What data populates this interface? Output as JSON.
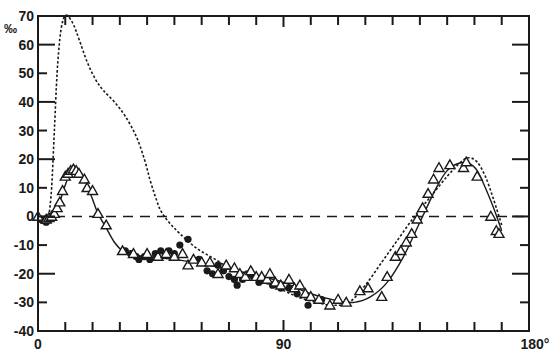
{
  "chart_data": {
    "type": "scatter",
    "title": "",
    "xlabel": "",
    "ylabel": "‰",
    "x_unit_label": "°",
    "xlim": [
      0,
      180
    ],
    "ylim": [
      -40,
      70
    ],
    "x_major_ticks": [
      0,
      90,
      180
    ],
    "x_tick_labels": [
      "0",
      "90",
      "180°"
    ],
    "x_minor_step": 10,
    "y_ticks": [
      -40,
      -30,
      -20,
      -10,
      0,
      10,
      20,
      30,
      40,
      50,
      60,
      70
    ],
    "y_tick_labels": [
      "-40",
      "-30",
      "-20",
      "-10",
      "0",
      "10",
      "20",
      "30",
      "40",
      "50",
      "60",
      "70"
    ],
    "y_unit_label": "‰",
    "grid": false,
    "legend": "none",
    "reference_lines": [
      {
        "y": 0,
        "style": "dashed"
      }
    ],
    "series": [
      {
        "name": "triangles",
        "marker": "open-triangle",
        "points": [
          [
            0,
            0
          ],
          [
            3,
            -1
          ],
          [
            4,
            -0.5
          ],
          [
            5,
            0
          ],
          [
            6,
            1
          ],
          [
            7,
            3
          ],
          [
            8,
            5
          ],
          [
            9,
            9
          ],
          [
            10,
            14
          ],
          [
            11,
            15
          ],
          [
            12,
            16
          ],
          [
            13,
            16.5
          ],
          [
            14,
            16
          ],
          [
            15,
            15
          ],
          [
            17,
            13
          ],
          [
            18,
            10
          ],
          [
            20,
            9
          ],
          [
            22,
            1
          ],
          [
            25,
            -3
          ],
          [
            31,
            -12
          ],
          [
            35,
            -13
          ],
          [
            40,
            -13
          ],
          [
            44,
            -14
          ],
          [
            47,
            -13
          ],
          [
            50,
            -14
          ],
          [
            53,
            -13
          ],
          [
            55,
            -17
          ],
          [
            57,
            -15
          ],
          [
            60,
            -16
          ],
          [
            63,
            -16
          ],
          [
            66,
            -20
          ],
          [
            69,
            -17
          ],
          [
            72,
            -18
          ],
          [
            74,
            -20
          ],
          [
            76,
            -21
          ],
          [
            78,
            -19
          ],
          [
            80,
            -21
          ],
          [
            82,
            -21
          ],
          [
            84,
            -22
          ],
          [
            85,
            -20
          ],
          [
            87,
            -23
          ],
          [
            89,
            -24
          ],
          [
            92,
            -22
          ],
          [
            94,
            -25
          ],
          [
            96,
            -24
          ],
          [
            98,
            -27
          ],
          [
            100,
            -28
          ],
          [
            103,
            -29
          ],
          [
            107,
            -31
          ],
          [
            110,
            -29
          ],
          [
            113,
            -30
          ],
          [
            118,
            -26
          ],
          [
            121,
            -25
          ],
          [
            126,
            -28
          ],
          [
            128,
            -21
          ],
          [
            131,
            -14
          ],
          [
            133,
            -12
          ],
          [
            135,
            -9
          ],
          [
            137,
            -6
          ],
          [
            139,
            -1
          ],
          [
            141,
            3
          ],
          [
            143,
            8
          ],
          [
            145,
            13
          ],
          [
            147,
            17
          ],
          [
            151,
            18
          ],
          [
            156,
            17
          ],
          [
            157,
            19
          ],
          [
            161,
            14
          ],
          [
            166,
            0
          ],
          [
            168,
            -5
          ],
          [
            169,
            -6
          ]
        ]
      },
      {
        "name": "filled circles",
        "marker": "filled-circle",
        "points": [
          [
            1,
            -1
          ],
          [
            2,
            -1.5
          ],
          [
            3,
            -2
          ],
          [
            4,
            -1
          ],
          [
            32,
            -12
          ],
          [
            34,
            -13
          ],
          [
            36,
            -14
          ],
          [
            37,
            -15
          ],
          [
            39,
            -14
          ],
          [
            41,
            -15
          ],
          [
            43,
            -13
          ],
          [
            45,
            -12
          ],
          [
            48,
            -12
          ],
          [
            50,
            -13
          ],
          [
            52,
            -10
          ],
          [
            55,
            -8
          ],
          [
            59,
            -15
          ],
          [
            62,
            -19
          ],
          [
            64,
            -20
          ],
          [
            66,
            -17
          ],
          [
            68,
            -19
          ],
          [
            70,
            -21
          ],
          [
            72,
            -22
          ],
          [
            73,
            -24
          ],
          [
            75,
            -22
          ],
          [
            77,
            -20
          ],
          [
            79,
            -21
          ],
          [
            81,
            -23
          ],
          [
            83,
            -22
          ],
          [
            86,
            -24
          ],
          [
            89,
            -25
          ],
          [
            92,
            -25
          ],
          [
            95,
            -27
          ],
          [
            99,
            -31
          ],
          [
            104,
            -29
          ]
        ]
      },
      {
        "name": "solid curve",
        "style": "solid-line",
        "points": [
          [
            0,
            0
          ],
          [
            2,
            -1
          ],
          [
            4,
            -1.5
          ],
          [
            6,
            0
          ],
          [
            8,
            5
          ],
          [
            10,
            11
          ],
          [
            12,
            15.5
          ],
          [
            14,
            16.5
          ],
          [
            16,
            15
          ],
          [
            18,
            11
          ],
          [
            20,
            6
          ],
          [
            22,
            1
          ],
          [
            25,
            -4
          ],
          [
            28,
            -9
          ],
          [
            31,
            -12
          ],
          [
            35,
            -13.5
          ],
          [
            40,
            -14
          ],
          [
            50,
            -15
          ],
          [
            60,
            -16.5
          ],
          [
            70,
            -18.5
          ],
          [
            80,
            -20.5
          ],
          [
            90,
            -23
          ],
          [
            100,
            -27
          ],
          [
            110,
            -29.5
          ],
          [
            116,
            -30
          ],
          [
            122,
            -28
          ],
          [
            128,
            -23
          ],
          [
            134,
            -14
          ],
          [
            140,
            -2
          ],
          [
            146,
            10
          ],
          [
            150,
            16
          ],
          [
            154,
            18.5
          ],
          [
            158,
            18.5
          ],
          [
            161,
            16
          ],
          [
            164,
            10
          ],
          [
            167,
            3
          ],
          [
            170,
            -5
          ]
        ]
      },
      {
        "name": "dotted curve",
        "style": "dotted-line",
        "points": [
          [
            4,
            0
          ],
          [
            5,
            10
          ],
          [
            6,
            30
          ],
          [
            7,
            50
          ],
          [
            8,
            62
          ],
          [
            9,
            68
          ],
          [
            10,
            70
          ],
          [
            11,
            70
          ],
          [
            13,
            67
          ],
          [
            15,
            62
          ],
          [
            18,
            54
          ],
          [
            21,
            48
          ],
          [
            24,
            44
          ],
          [
            28,
            40
          ],
          [
            32,
            35
          ],
          [
            36,
            28
          ],
          [
            39,
            20
          ],
          [
            41,
            13
          ],
          [
            43,
            7
          ],
          [
            45,
            2
          ],
          [
            48,
            -2
          ],
          [
            52,
            -6
          ],
          [
            58,
            -11
          ],
          [
            65,
            -15
          ],
          [
            72,
            -19
          ],
          [
            80,
            -22
          ],
          [
            88,
            -25
          ],
          [
            95,
            -28
          ],
          [
            102,
            -30
          ],
          [
            108,
            -31
          ],
          [
            114,
            -30
          ],
          [
            120,
            -24
          ],
          [
            126,
            -16
          ],
          [
            132,
            -8
          ],
          [
            138,
            0
          ],
          [
            144,
            7
          ],
          [
            150,
            14
          ],
          [
            155,
            19
          ],
          [
            158,
            20.5
          ],
          [
            161,
            19
          ],
          [
            164,
            14
          ],
          [
            167,
            6
          ],
          [
            170,
            -3
          ]
        ]
      }
    ]
  }
}
